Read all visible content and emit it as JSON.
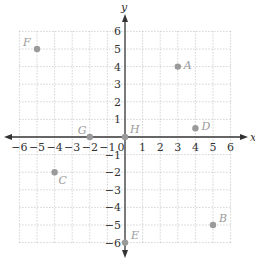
{
  "chart_data": {
    "type": "scatter",
    "title": "",
    "xlabel": "x",
    "ylabel": "y",
    "xlim": [
      -6,
      6
    ],
    "ylim": [
      -6,
      6
    ],
    "grid": true,
    "x_ticks": [
      "-6",
      "-5",
      "-4",
      "-3",
      "-2",
      "-1",
      "0",
      "1",
      "2",
      "3",
      "4",
      "5",
      "6"
    ],
    "y_ticks": [
      "-6",
      "-5",
      "-4",
      "-3",
      "-2",
      "-1",
      "1",
      "2",
      "3",
      "4",
      "5",
      "6"
    ],
    "points": [
      {
        "label": "A",
        "x": 3,
        "y": 4
      },
      {
        "label": "B",
        "x": 5,
        "y": -5
      },
      {
        "label": "C",
        "x": -4,
        "y": -2
      },
      {
        "label": "D",
        "x": 4,
        "y": 0.5
      },
      {
        "label": "E",
        "x": 0,
        "y": -6
      },
      {
        "label": "F",
        "x": -5,
        "y": 5
      },
      {
        "label": "G",
        "x": -2,
        "y": 0
      },
      {
        "label": "H",
        "x": 0,
        "y": 0
      }
    ],
    "colors": {
      "axis": "#333333",
      "grid": "#bdbdbd",
      "point": "#9a9a9a",
      "point_label": "#9a9a9a"
    }
  }
}
